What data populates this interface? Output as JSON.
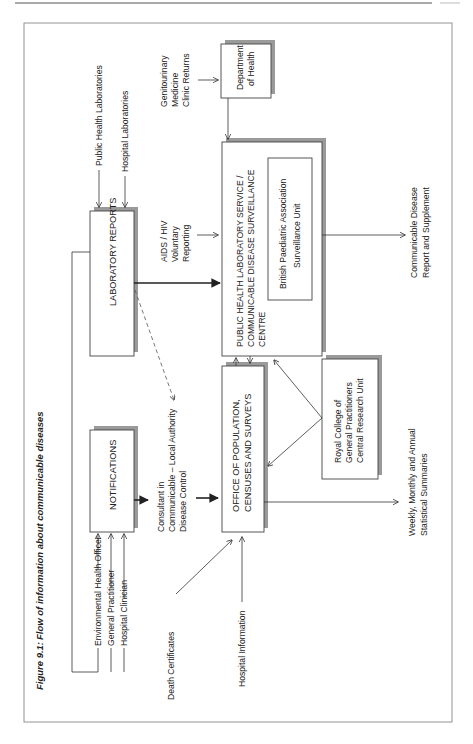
{
  "page": {
    "orientation": "rotated-90-ccw",
    "page_number": "",
    "figure_label": "Figure 9.1:",
    "figure_title": "Flow of information about communicable diseases"
  },
  "diagram": {
    "boxes": {
      "laboratory_reports": "LABORATORY REPORTS",
      "notifications": "NOTIFICATIONS",
      "phls_cdsc": [
        "PUBLIC HEALTH LABORATORY SERVICE /",
        "COMMUNICABLE DISEASE SURVEILLANCE",
        "CENTRE"
      ],
      "bpa_unit": [
        "British Paediatric Association",
        "Surveillance Unit"
      ],
      "department_of_health": [
        "Department",
        "of Health"
      ],
      "opcs": [
        "OFFICE OF POPULATION,",
        "CENSUSES AND SURVEYS"
      ],
      "rcgp": [
        "Royal College of",
        "General Practitioners",
        "Central Research Unit"
      ]
    },
    "sources": {
      "public_health_labs": "Public Health Laboratories",
      "hospital_labs": "Hospital Laboratories",
      "environmental_health_officer": "Environmental Health Officer",
      "general_practitioner": "General Practitioner",
      "hospital_clinician": "Hospital Clinician",
      "death_certificates": "Death Certificates",
      "hospital_information": "Hospital Information",
      "aids_hiv": [
        "AIDS / HIV",
        "Voluntary",
        "Reporting"
      ],
      "gum_returns": [
        "Genitourinary",
        "Medicine",
        "Clinic Returns"
      ],
      "consultant": [
        "Consultant in",
        "Communicable – Local Authority",
        "Disease Control"
      ]
    },
    "outputs": {
      "weekly_summaries": [
        "Weekly, Monthly and Annual",
        "Statistical Summaries"
      ],
      "cdr": [
        "Communicable Disease",
        "Report and Supplement"
      ]
    }
  },
  "colors": {
    "line": "#333333",
    "shadow": "#9a9a9a",
    "frame": "#888888"
  }
}
